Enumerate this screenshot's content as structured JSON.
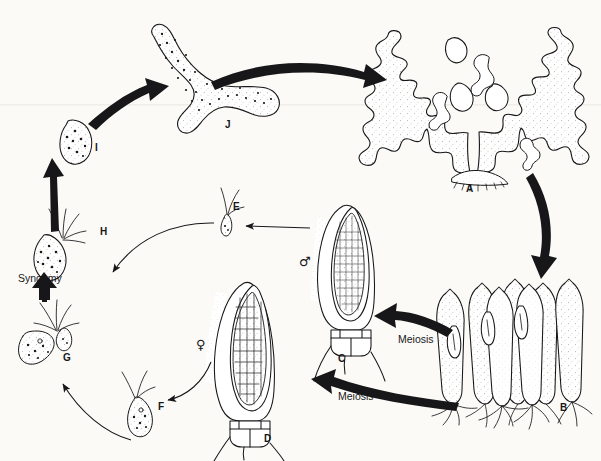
{
  "figure": {
    "kind": "biological-life-cycle-diagram",
    "background_color": "#fbfaf6",
    "ink_color": "#17171a",
    "tint_color": "#e9e7e0"
  },
  "stage_labels": [
    {
      "id": "A",
      "text": "A",
      "x": 466,
      "y": 184,
      "caption": "mature branched sporophyte thallus"
    },
    {
      "id": "B",
      "text": "B",
      "x": 560,
      "y": 403,
      "caption": "cluster of sporangia on stalks"
    },
    {
      "id": "C",
      "text": "C",
      "x": 338,
      "y": 354,
      "caption": "male sporangium with many small spores"
    },
    {
      "id": "D",
      "text": "D",
      "x": 264,
      "y": 434,
      "caption": "female sporangium with large spores"
    },
    {
      "id": "E",
      "text": "E",
      "x": 233,
      "y": 202,
      "caption": "small male zoospore with flagella"
    },
    {
      "id": "F",
      "text": "F",
      "x": 158,
      "y": 402,
      "caption": "large female zoospore with flagella"
    },
    {
      "id": "G",
      "text": "G",
      "x": 63,
      "y": 353,
      "caption": "fusing gamete pair"
    },
    {
      "id": "H",
      "text": "H",
      "x": 100,
      "y": 227,
      "caption": "flagellated zygote"
    },
    {
      "id": "I",
      "text": "I",
      "x": 95,
      "y": 143,
      "caption": "settled germinating zygote"
    },
    {
      "id": "J",
      "text": "J",
      "x": 225,
      "y": 120,
      "caption": "young branching sporeling"
    }
  ],
  "process_labels": [
    {
      "id": "meiosis-upper",
      "text": "Meiosis",
      "x": 398,
      "y": 334
    },
    {
      "id": "meiosis-lower",
      "text": "Meiosis",
      "x": 338,
      "y": 391
    },
    {
      "id": "syngamy",
      "text": "Syngamy",
      "x": 18,
      "y": 273
    }
  ],
  "sex_symbols": [
    {
      "id": "male",
      "text": "♂",
      "x": 299,
      "y": 255
    },
    {
      "id": "female",
      "text": "♀",
      "x": 196,
      "y": 338
    }
  ],
  "arrows": [
    {
      "id": "arrow-j-to-a",
      "from": "J",
      "to": "A",
      "weight": "thick"
    },
    {
      "id": "arrow-a-to-b",
      "from": "A",
      "to": "B",
      "weight": "thick"
    },
    {
      "id": "arrow-b-to-c",
      "from": "B",
      "to": "C",
      "weight": "thick",
      "label": "Meiosis"
    },
    {
      "id": "arrow-b-to-d",
      "from": "B",
      "to": "D",
      "weight": "thick",
      "label": "Meiosis"
    },
    {
      "id": "arrow-c-to-e",
      "from": "C",
      "to": "E",
      "weight": "thin"
    },
    {
      "id": "arrow-d-to-f",
      "from": "D",
      "to": "F",
      "weight": "thin"
    },
    {
      "id": "arrow-e-to-g",
      "from": "E",
      "to": "G",
      "weight": "thin"
    },
    {
      "id": "arrow-f-to-g",
      "from": "F",
      "to": "G",
      "weight": "thin"
    },
    {
      "id": "arrow-g-to-h",
      "from": "G",
      "to": "H",
      "weight": "thick",
      "label": "Syngamy"
    },
    {
      "id": "arrow-h-to-i",
      "from": "H",
      "to": "I",
      "weight": "thick"
    },
    {
      "id": "arrow-i-to-j",
      "from": "I",
      "to": "J",
      "weight": "thick"
    }
  ]
}
